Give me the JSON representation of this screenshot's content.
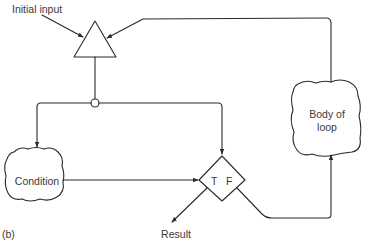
{
  "diagram": {
    "figure_label": "(b)",
    "nodes": {
      "initial_input": {
        "label": "Initial input",
        "shape": "triangle"
      },
      "junction": {
        "shape": "circle"
      },
      "condition": {
        "label": "Condition",
        "shape": "cloud"
      },
      "decision": {
        "shape": "diamond",
        "true_label": "T",
        "false_label": "F"
      },
      "body": {
        "label_line1": "Body of",
        "label_line2": "loop",
        "shape": "cloud"
      },
      "result": {
        "label": "Result"
      }
    },
    "edges": [
      {
        "from": "initial_input_label",
        "to": "initial_input"
      },
      {
        "from": "body",
        "to": "initial_input"
      },
      {
        "from": "initial_input",
        "to": "junction"
      },
      {
        "from": "junction",
        "to": "condition"
      },
      {
        "from": "junction",
        "to": "decision"
      },
      {
        "from": "condition",
        "to": "decision"
      },
      {
        "from": "decision",
        "to": "result",
        "label": "T"
      },
      {
        "from": "decision",
        "to": "body",
        "label": "F"
      }
    ],
    "colors": {
      "stroke": "#2a2a2a",
      "text": "#3a3a3a",
      "background": "#ffffff"
    }
  }
}
